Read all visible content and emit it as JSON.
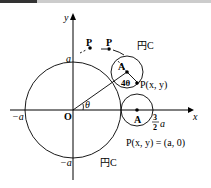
{
  "diagram": {
    "axes": {
      "x_label": "x",
      "y_label": "y",
      "origin_label": "O"
    },
    "ticks": {
      "a_top": "a",
      "neg_a_left": "−a",
      "neg_a_bottom": "−a",
      "three_half_num": "3",
      "three_half_den": "2",
      "three_half_a": "a"
    },
    "circles": {
      "c1_label": "円C",
      "c1_sub": "1",
      "c2_label": "円C",
      "c2_sub": "2"
    },
    "points": {
      "P1": "P",
      "P2": "P",
      "A_upper": "A",
      "A_lower": "A",
      "P_upper": "P(x, y)",
      "P_lower": "P(x, y) = (a, 0)"
    },
    "angles": {
      "theta": "θ",
      "four_theta": "4θ"
    }
  }
}
